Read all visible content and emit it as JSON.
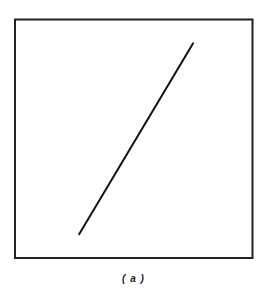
{
  "figure": {
    "caption": "( a )",
    "frame_color": "#222222",
    "line_color": "#111111",
    "line": {
      "description": "single straight line segment with positive slope inside square frame",
      "start_fraction": [
        0.27,
        0.1
      ],
      "end_fraction": [
        0.75,
        0.9
      ]
    }
  }
}
